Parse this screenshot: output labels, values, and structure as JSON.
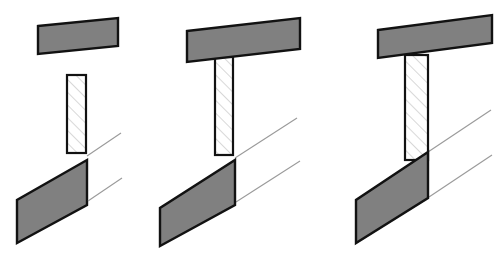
{
  "figure": {
    "background_color": "#ffffff",
    "panel_count": 3,
    "colors": {
      "slab_fill": "#808080",
      "column_fill": "#ffffff",
      "outline": "#121212",
      "hatch_line": "#b9b9b9",
      "thin_guide_line": "#9a9a9a"
    },
    "panels": [
      {
        "id": "panel-1",
        "label": "Stage 1 - separated members",
        "stage_number": "1",
        "description": "Upper slab, free-standing hatched column and lower slab all detached",
        "elements": [
          {
            "name": "upper-slab",
            "kind": "slab",
            "fill": "#808080",
            "points": "38,26 118,18 118,46 38,54"
          },
          {
            "name": "column",
            "kind": "hatched-column",
            "fill": "#ffffff",
            "points": "67,75 86,75 86,153 67,153"
          },
          {
            "name": "lower-slab",
            "kind": "slab",
            "fill": "#808080",
            "points": "87,160 87,205 17,243 17,200"
          },
          {
            "name": "guide-line-upper",
            "kind": "thin-line",
            "points": "87,156 121,133"
          },
          {
            "name": "guide-line-lower",
            "kind": "thin-line",
            "points": "88,201 122,178"
          }
        ]
      },
      {
        "id": "panel-2",
        "label": "Stage 2 - column joined to upper slab",
        "stage_number": "2",
        "description": "Hatched column fixed beneath the upper slab, lower slab still detached",
        "elements": [
          {
            "name": "upper-slab",
            "kind": "slab",
            "fill": "#808080",
            "points": "187,31 300,18 300,49 187,62"
          },
          {
            "name": "column",
            "kind": "hatched-column",
            "fill": "#ffffff",
            "points": "215,57 233,57 233,155 215,155"
          },
          {
            "name": "lower-slab",
            "kind": "slab",
            "fill": "#808080",
            "points": "235,160 235,205 160,246 160,208"
          },
          {
            "name": "guide-line-upper",
            "kind": "thin-line",
            "points": "235,158 297,118"
          },
          {
            "name": "guide-line-lower",
            "kind": "thin-line",
            "points": "236,202 300,161"
          }
        ]
      },
      {
        "id": "panel-3",
        "label": "Stage 3 - complete connection",
        "stage_number": "3",
        "description": "Column fully connected between upper slab and lower slab",
        "elements": [
          {
            "name": "upper-slab",
            "kind": "slab",
            "fill": "#808080",
            "points": "378,30 492,15 492,43 378,58"
          },
          {
            "name": "column",
            "kind": "hatched-column",
            "fill": "#ffffff",
            "points": "405,55 428,55 428,160 405,160"
          },
          {
            "name": "lower-slab",
            "kind": "slab",
            "fill": "#808080",
            "points": "428,152 428,198 356,243 356,200"
          },
          {
            "name": "guide-line-upper",
            "kind": "thin-line",
            "points": "428,152 491,110"
          },
          {
            "name": "guide-line-lower",
            "kind": "thin-line",
            "points": "429,197 492,155"
          }
        ]
      }
    ]
  }
}
